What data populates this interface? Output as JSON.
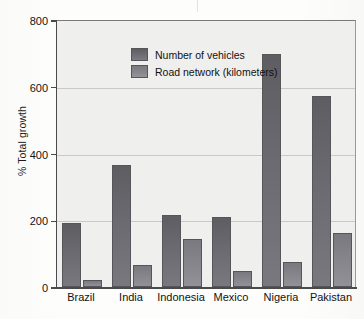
{
  "chart_data": {
    "type": "bar",
    "title": "",
    "xlabel": "",
    "ylabel": "% Total growth",
    "ylim": [
      0,
      800
    ],
    "yticks": [
      0,
      200,
      400,
      600,
      800
    ],
    "ytick_labels": [
      "0",
      "200",
      "400",
      "600",
      "800"
    ],
    "grid": true,
    "legend_position": "top-left-inside",
    "categories": [
      "Brazil",
      "India",
      "Indonesia",
      "Mexico",
      "Nigeria",
      "Pakistan"
    ],
    "series": [
      {
        "name": "Number of vehicles",
        "color": "#6a6a70",
        "values": [
          193,
          365,
          215,
          210,
          698,
          572
        ]
      },
      {
        "name": "Road network (kilometers)",
        "color": "#88888e",
        "values": [
          22,
          67,
          143,
          47,
          75,
          163
        ]
      }
    ]
  },
  "axis": {
    "y_label": "% Total growth",
    "ticks": [
      {
        "value": 800,
        "label": "800"
      },
      {
        "value": 600,
        "label": "600"
      },
      {
        "value": 400,
        "label": "400"
      },
      {
        "value": 200,
        "label": "200"
      },
      {
        "value": 0,
        "label": "0"
      }
    ]
  },
  "legend": {
    "items": [
      {
        "label": "Number of vehicles",
        "swatch": "vehicles"
      },
      {
        "label": "Road network (kilometers)",
        "swatch": "roads"
      }
    ]
  }
}
